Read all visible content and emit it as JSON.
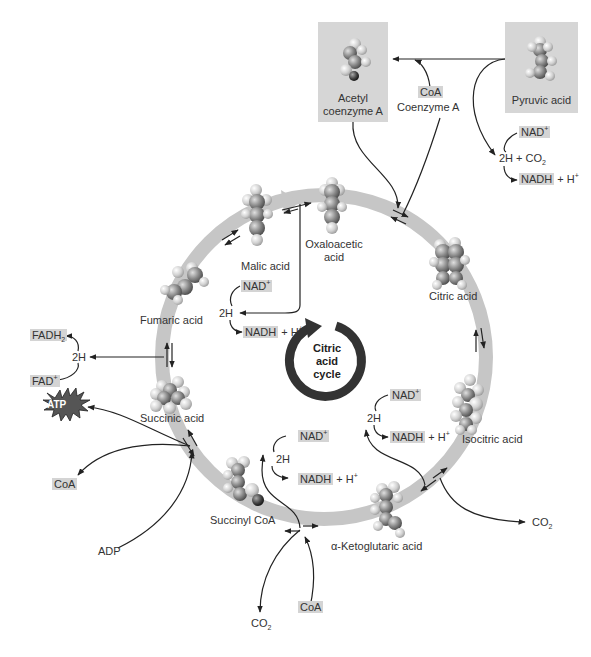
{
  "title": "Citric acid cycle",
  "colors": {
    "ring": "#c6c6c6",
    "label_box": "#d4d4d4",
    "cycle_icon": "#333333",
    "arrows": "#222222",
    "atp_star": "#555555"
  },
  "center_icon": {
    "line1": "Citric",
    "line2": "acid",
    "line3": "cycle"
  },
  "inputs": {
    "acetyl_coa": {
      "line1": "Acetyl",
      "line2": "coenzyme A"
    },
    "pyruvic_acid": "Pyruvic acid",
    "coa_box": "CoA",
    "coenzyme_a": "Coenzyme A"
  },
  "pyruvate_reaction": {
    "nad": "NAD",
    "nad_sup": "+",
    "products": "2H + CO",
    "products_sub": "2",
    "nadh": "NADH",
    "h": "+ H",
    "h_sup": "+"
  },
  "intermediates": {
    "oxaloacetic": {
      "line1": "Oxaloacetic",
      "line2": "acid"
    },
    "citric": "Citric acid",
    "isocitric": "Isocitric acid",
    "ketoglutaric": "α-Ketoglutaric acid",
    "succinyl_coa": "Succinyl CoA",
    "succinic": "Succinic acid",
    "fumaric": "Fumaric acid",
    "malic": "Malic acid"
  },
  "malate_reaction": {
    "nad": "NAD",
    "nad_sup": "+",
    "h2": "2H",
    "nadh": "NADH",
    "h": "+ H",
    "h_sup": "+"
  },
  "isocitrate_reaction": {
    "nad": "NAD",
    "nad_sup": "+",
    "h2": "2H",
    "nadh": "NADH",
    "h": "+ H",
    "h_sup": "+",
    "co2": "CO",
    "co2_sub": "2"
  },
  "ketoglutarate_reaction": {
    "nad": "NAD",
    "nad_sup": "+",
    "h2": "2H",
    "nadh": "NADH",
    "h": "+ H",
    "h_sup": "+",
    "co2": "CO",
    "co2_sub": "2",
    "coa": "CoA"
  },
  "succinate_reaction": {
    "fadh": "FADH",
    "fadh_sub": "2",
    "h2": "2H",
    "fad": "FAD",
    "fad_sup": "+"
  },
  "atp_reaction": {
    "atp": "ATP",
    "coa": "CoA",
    "adp": "ADP"
  }
}
